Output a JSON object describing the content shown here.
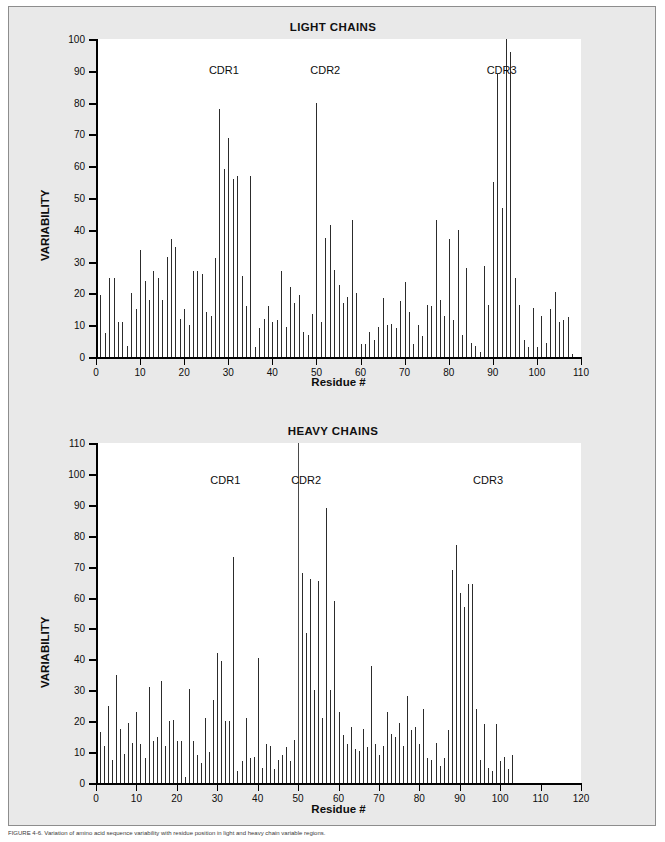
{
  "figure": {
    "background_color": "#e9e9e9",
    "plot_background_color": "#ffffff",
    "bar_color": "#2c2c2c",
    "caption": "FIGURE 4-6. Variation of amino acid sequence variability with residue position in light and heavy chain variable regions."
  },
  "chart_data": [
    {
      "type": "bar",
      "title": "LIGHT CHAINS",
      "xlabel": "Residue #",
      "ylabel": "VARIABILITY",
      "xlim": [
        0,
        110
      ],
      "ylim": [
        0,
        100
      ],
      "xticks": [
        0,
        10,
        20,
        30,
        40,
        50,
        60,
        70,
        80,
        90,
        100,
        110
      ],
      "yticks": [
        0,
        10,
        20,
        30,
        40,
        50,
        60,
        70,
        80,
        90,
        100
      ],
      "grid": false,
      "legend": "none",
      "annotations": [
        {
          "text": "CDR1",
          "x": 29,
          "y": 92
        },
        {
          "text": "CDR2",
          "x": 52,
          "y": 92
        },
        {
          "text": "CDR3",
          "x": 92,
          "y": 92
        }
      ],
      "x": [
        1,
        2,
        3,
        4,
        5,
        6,
        7,
        8,
        9,
        10,
        11,
        12,
        13,
        14,
        15,
        16,
        17,
        18,
        19,
        20,
        21,
        22,
        23,
        24,
        25,
        26,
        27,
        28,
        29,
        30,
        31,
        32,
        33,
        34,
        35,
        36,
        37,
        38,
        39,
        40,
        41,
        42,
        43,
        44,
        45,
        46,
        47,
        48,
        49,
        50,
        51,
        52,
        53,
        54,
        55,
        56,
        57,
        58,
        59,
        60,
        61,
        62,
        63,
        64,
        65,
        66,
        67,
        68,
        69,
        70,
        71,
        72,
        73,
        74,
        75,
        76,
        77,
        78,
        79,
        80,
        81,
        82,
        83,
        84,
        85,
        86,
        87,
        88,
        89,
        90,
        91,
        92,
        93,
        94,
        95,
        96,
        97,
        98,
        99,
        100,
        101,
        102,
        103,
        104,
        105,
        106,
        107,
        108,
        109,
        110
      ],
      "values": [
        19.5,
        7.5,
        25,
        25,
        11,
        11,
        3.5,
        20,
        15,
        33.5,
        24,
        18,
        27,
        25,
        18,
        31.5,
        37,
        34.5,
        12,
        15,
        10,
        27,
        27,
        26,
        14,
        13,
        31,
        78,
        59,
        69,
        56,
        57,
        25.5,
        16,
        57,
        3,
        9,
        12,
        16,
        11,
        11.5,
        27,
        9.5,
        22,
        17,
        19.5,
        8,
        7,
        13.5,
        80,
        11,
        37.5,
        41.5,
        27.5,
        22.5,
        17,
        19,
        43,
        20,
        4,
        4,
        8,
        5.5,
        9.5,
        18.5,
        10,
        10.5,
        9,
        17.5,
        23.5,
        14,
        4,
        10,
        6.5,
        16.5,
        16,
        43,
        18,
        13,
        37,
        11.5,
        40,
        7,
        28,
        4.5,
        3.5,
        1.5,
        28.5,
        16.5,
        55,
        89,
        47,
        100,
        96,
        25,
        16.5,
        5.5,
        3,
        15.5,
        3,
        13,
        4.5,
        15,
        20.5,
        11,
        11.5,
        12.5,
        1
      ]
    },
    {
      "type": "bar",
      "title": "HEAVY CHAINS",
      "xlabel": "Residue #",
      "ylabel": "VARIABILITY",
      "xlim": [
        0,
        120
      ],
      "ylim": [
        0,
        110
      ],
      "xticks": [
        0,
        10,
        20,
        30,
        40,
        50,
        60,
        70,
        80,
        90,
        100,
        110,
        120
      ],
      "yticks": [
        0,
        10,
        20,
        30,
        40,
        50,
        60,
        70,
        80,
        90,
        100,
        110
      ],
      "grid": false,
      "legend": "none",
      "annotations": [
        {
          "text": "CDR1",
          "x": 32,
          "y": 100
        },
        {
          "text": "CDR2",
          "x": 52,
          "y": 100
        },
        {
          "text": "CDR3",
          "x": 97,
          "y": 100
        }
      ],
      "x": [
        1,
        2,
        3,
        4,
        5,
        6,
        7,
        8,
        9,
        10,
        11,
        12,
        13,
        14,
        15,
        16,
        17,
        18,
        19,
        20,
        21,
        22,
        23,
        24,
        25,
        26,
        27,
        28,
        29,
        30,
        31,
        32,
        33,
        34,
        35,
        36,
        37,
        38,
        39,
        40,
        41,
        42,
        43,
        44,
        45,
        46,
        47,
        48,
        49,
        50,
        51,
        52,
        53,
        54,
        55,
        56,
        57,
        58,
        59,
        60,
        61,
        62,
        63,
        64,
        65,
        66,
        67,
        68,
        69,
        70,
        71,
        72,
        73,
        74,
        75,
        76,
        77,
        78,
        79,
        80,
        81,
        82,
        83,
        84,
        85,
        86,
        87,
        88,
        89,
        90,
        91,
        92,
        93,
        94,
        95,
        96,
        97,
        98,
        99,
        100,
        101,
        102,
        103,
        104,
        105,
        106,
        107,
        108,
        109,
        110,
        111,
        112,
        113
      ],
      "values": [
        16.5,
        12,
        25,
        7.5,
        35,
        17.5,
        9.5,
        19.5,
        13,
        23,
        12.5,
        8,
        31,
        13.5,
        15,
        33,
        12,
        20,
        20.5,
        13.5,
        13.5,
        2,
        30.5,
        13.5,
        9,
        6.5,
        21,
        10,
        27,
        42,
        39.5,
        20,
        20,
        73,
        4,
        7,
        21,
        8,
        8.5,
        40.5,
        5,
        12.5,
        12,
        4.5,
        7.5,
        9,
        11.5,
        7,
        14,
        110,
        68,
        48.5,
        66,
        30,
        65.5,
        21,
        89,
        30,
        59,
        23,
        15.5,
        12.5,
        18,
        11,
        10.5,
        17.5,
        11.5,
        38,
        12.5,
        9,
        12,
        23,
        16,
        15,
        19.5,
        12,
        28,
        17,
        18,
        12.5,
        24,
        8,
        7.5,
        13,
        5.5,
        8,
        17,
        69,
        77,
        61.5,
        57,
        64.5,
        64.5,
        24,
        7.5,
        19,
        5,
        4,
        19,
        7,
        8.5,
        4.5,
        9
      ]
    }
  ],
  "marker_lines": [
    {
      "panel": "heavy",
      "x": 50,
      "to_top": true
    }
  ]
}
